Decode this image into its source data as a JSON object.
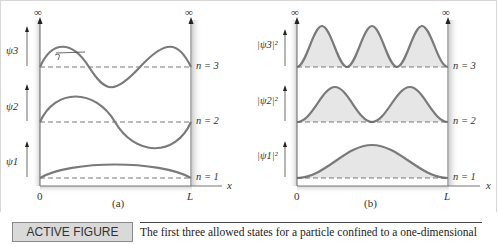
{
  "figure": {
    "panel_a": {
      "label": "(a)",
      "y_labels": [
        "ψ3",
        "ψ2",
        "ψ1"
      ],
      "levels": [
        "n = 3",
        "n = 2",
        "n = 1"
      ],
      "x_axis_label": "x",
      "x_origin_label": "0",
      "x_end_label": "L",
      "wall_label": "∞"
    },
    "panel_b": {
      "label": "(b)",
      "y_labels": [
        "|ψ3|²",
        "|ψ2|²",
        "|ψ1|²"
      ],
      "levels": [
        "n = 3",
        "n = 2",
        "n = 1"
      ],
      "x_axis_label": "x",
      "x_origin_label": "0",
      "x_end_label": "L",
      "wall_label": "∞"
    },
    "colors": {
      "curve": "#7a7a7a",
      "fill": "#e6e6e6",
      "caption_box": "#d9d9d9"
    }
  },
  "caption": {
    "tag_prefix": "ACTIVE FIGURE ",
    "tag_number": "28.23",
    "text": "The first three allowed states for a particle confined to a one-dimensional"
  }
}
